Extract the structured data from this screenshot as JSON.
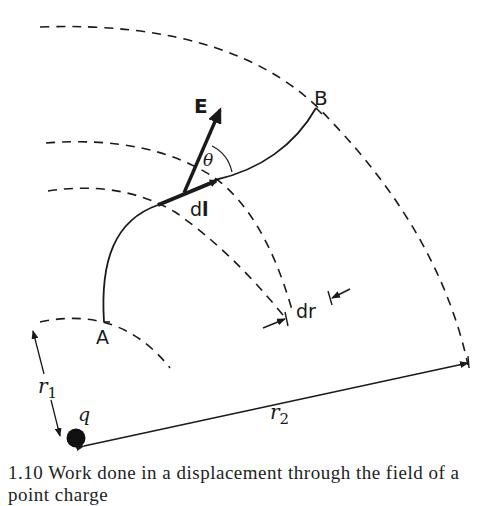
{
  "figure": {
    "labels": {
      "field_vector": "E",
      "displacement": "d",
      "displacement_bold": "l",
      "angle": "θ",
      "point_a": "A",
      "point_b": "B",
      "radial_increment": "dr",
      "radius_1": "r",
      "radius_1_sub": "1",
      "radius_2": "r",
      "radius_2_sub": "2",
      "charge": "q"
    },
    "caption_fragment": "1.10  Work done in a displacement through the field of a point charge"
  },
  "colors": {
    "ink": "#1a1a1a",
    "background": "#ffffff"
  }
}
